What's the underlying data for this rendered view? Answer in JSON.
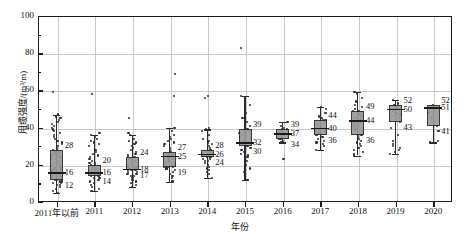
{
  "chart_data": {
    "type": "box",
    "title": "",
    "xlabel": "年份",
    "ylabel": "用缆强度/(m³/m)",
    "ylim": [
      0,
      100
    ],
    "ytick_labels": [
      "0",
      "20",
      "40",
      "60",
      "80",
      "100"
    ],
    "ytick_values": [
      0,
      20,
      40,
      60,
      80,
      100
    ],
    "yminor_values": [
      10,
      30,
      50,
      70,
      90
    ],
    "grid": "both",
    "legend": "none",
    "categories": [
      "2011年以前",
      "2011",
      "2012",
      "2013",
      "2014",
      "2015",
      "2016",
      "2017",
      "2018",
      "2019",
      "2020"
    ],
    "boxes": [
      {
        "category": "2011年以前",
        "q3": 28,
        "median": 16,
        "q1": 12,
        "whisker_high": 47,
        "whisker_low": 5,
        "labels": {
          "top": "28",
          "mid": "16",
          "bottom": "12"
        }
      },
      {
        "category": "2011",
        "q3": 20,
        "median": 16,
        "q1": 14,
        "whisker_high": 36,
        "whisker_low": 6,
        "labels": {
          "top": "20",
          "mid": "16",
          "bottom": "14"
        }
      },
      {
        "category": "2012",
        "q3": 24,
        "median": 18,
        "q1": 17,
        "whisker_high": 36,
        "whisker_low": 8,
        "labels": {
          "top": "24",
          "mid": "18",
          "bottom": "17"
        }
      },
      {
        "category": "2013",
        "q3": 27,
        "median": 25,
        "q1": 19,
        "whisker_high": 40,
        "whisker_low": 11,
        "labels": {
          "top": "27",
          "mid": "25",
          "bottom": "19"
        }
      },
      {
        "category": "2014",
        "q3": 28,
        "median": 26,
        "q1": 24,
        "whisker_high": 39,
        "whisker_low": 13,
        "labels": {
          "top": "28",
          "mid": "26",
          "bottom": "24"
        }
      },
      {
        "category": "2015",
        "q3": 39,
        "median": 32,
        "q1": 30,
        "whisker_high": 57,
        "whisker_low": 12,
        "labels": {
          "top": "39",
          "mid": "32",
          "bottom": "30"
        }
      },
      {
        "category": "2016",
        "q3": 39,
        "median": 37,
        "q1": 34,
        "whisker_high": 43,
        "whisker_low": 32,
        "labels": {
          "top": "39",
          "mid": "37",
          "bottom": "34"
        }
      },
      {
        "category": "2017",
        "q3": 44,
        "median": 40,
        "q1": 36,
        "whisker_high": 51,
        "whisker_low": 28,
        "labels": {
          "top": "44",
          "mid": "40",
          "bottom": "36"
        }
      },
      {
        "category": "2018",
        "q3": 49,
        "median": 44,
        "q1": 36,
        "whisker_high": 59,
        "whisker_low": 25,
        "labels": {
          "top": "49",
          "mid": "44",
          "bottom": "36"
        }
      },
      {
        "category": "2019",
        "q3": 52,
        "median": 50,
        "q1": 43,
        "whisker_high": 55,
        "whisker_low": 26,
        "labels": {
          "top": "52",
          "mid": "50",
          "bottom": "43"
        }
      },
      {
        "category": "2020",
        "q3": 52,
        "median": 51,
        "q1": 41,
        "whisker_high": 52,
        "whisker_low": 32,
        "labels": {
          "top": "52",
          "mid": "51",
          "bottom": "41"
        }
      }
    ],
    "scatter": [
      {
        "category": "2011年以前",
        "values": [
          59,
          47,
          46,
          45,
          44,
          43,
          42,
          41,
          40,
          39,
          38,
          37,
          36,
          35,
          34,
          33,
          32,
          31,
          30,
          29,
          28,
          28,
          27,
          27,
          26,
          26,
          25,
          25,
          24,
          24,
          23,
          23,
          22,
          22,
          21,
          21,
          20,
          20,
          19,
          19,
          18,
          18,
          17,
          17,
          16,
          16,
          16,
          15,
          15,
          15,
          14,
          14,
          14,
          13,
          13,
          13,
          12,
          12,
          12,
          11,
          11,
          10,
          10,
          9,
          9,
          8,
          7,
          6,
          5
        ]
      },
      {
        "category": "2011",
        "values": [
          58,
          37,
          36,
          35,
          34,
          33,
          32,
          31,
          30,
          28,
          27,
          26,
          25,
          24,
          23,
          22,
          21,
          21,
          20,
          20,
          19,
          19,
          18,
          18,
          17,
          17,
          17,
          16,
          16,
          16,
          16,
          15,
          15,
          15,
          15,
          14,
          14,
          14,
          13,
          13,
          12,
          12,
          11,
          10,
          9,
          8,
          7,
          6
        ]
      },
      {
        "category": "2012",
        "values": [
          45,
          37,
          36,
          34,
          33,
          32,
          31,
          30,
          29,
          28,
          27,
          26,
          25,
          24,
          24,
          23,
          22,
          22,
          21,
          21,
          20,
          20,
          19,
          19,
          18,
          18,
          18,
          17,
          17,
          17,
          16,
          16,
          15,
          15,
          14,
          14,
          13,
          12,
          11,
          10,
          9,
          8
        ]
      },
      {
        "category": "2013",
        "values": [
          69,
          57,
          40,
          38,
          36,
          35,
          34,
          33,
          32,
          31,
          30,
          29,
          28,
          27,
          27,
          26,
          26,
          25,
          25,
          25,
          24,
          24,
          23,
          23,
          22,
          22,
          21,
          21,
          20,
          20,
          19,
          19,
          19,
          18,
          18,
          17,
          16,
          15,
          14,
          13,
          11
        ]
      },
      {
        "category": "2014",
        "values": [
          57,
          56,
          40,
          39,
          38,
          36,
          34,
          33,
          32,
          31,
          30,
          29,
          28,
          28,
          27,
          27,
          26,
          26,
          26,
          25,
          25,
          25,
          24,
          24,
          24,
          23,
          23,
          22,
          22,
          21,
          20,
          19,
          18,
          17,
          16,
          15,
          13
        ]
      },
      {
        "category": "2015",
        "values": [
          83,
          57,
          52,
          48,
          45,
          43,
          41,
          39,
          38,
          37,
          36,
          35,
          34,
          33,
          33,
          32,
          32,
          32,
          31,
          31,
          30,
          30,
          29,
          28,
          27,
          26,
          25,
          24,
          22,
          20,
          18,
          16,
          12
        ]
      },
      {
        "category": "2016",
        "values": [
          43,
          41,
          40,
          39,
          39,
          38,
          38,
          37,
          37,
          37,
          36,
          36,
          35,
          35,
          34,
          34,
          33,
          32,
          23
        ]
      },
      {
        "category": "2017",
        "values": [
          51,
          50,
          48,
          46,
          45,
          44,
          44,
          43,
          42,
          41,
          41,
          40,
          40,
          39,
          39,
          38,
          38,
          37,
          37,
          36,
          36,
          35,
          34,
          33,
          32,
          31,
          30,
          28
        ]
      },
      {
        "category": "2018",
        "values": [
          59,
          58,
          56,
          54,
          52,
          51,
          50,
          49,
          49,
          48,
          47,
          46,
          45,
          45,
          44,
          44,
          43,
          42,
          41,
          40,
          39,
          38,
          37,
          36,
          36,
          35,
          34,
          33,
          32,
          31,
          30,
          29,
          28,
          27,
          26,
          25
        ]
      },
      {
        "category": "2019",
        "values": [
          55,
          53,
          52,
          52,
          51,
          50,
          50,
          49,
          48,
          47,
          45,
          43,
          40,
          36,
          33,
          31,
          30,
          29,
          28,
          27,
          26
        ]
      },
      {
        "category": "2020",
        "values": [
          52,
          51,
          48,
          45,
          41,
          38,
          33,
          32
        ]
      }
    ]
  }
}
